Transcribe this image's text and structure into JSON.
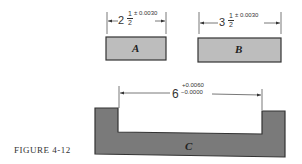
{
  "figure": {
    "caption": "FIGURE 4-12",
    "colors": {
      "part_ab_fill": "#bdbdbd",
      "part_c_fill": "#7a7a7a",
      "outline": "#333333"
    },
    "parts": [
      {
        "label": "A",
        "dimension": {
          "whole": "2",
          "numerator": "1",
          "denominator": "2",
          "tolerance": "± 0.0030"
        }
      },
      {
        "label": "B",
        "dimension": {
          "whole": "3",
          "numerator": "1",
          "denominator": "2",
          "tolerance": "± 0.0030"
        }
      },
      {
        "label": "C",
        "dimension": {
          "nominal": "6",
          "upper_tolerance": "+0.0060",
          "lower_tolerance": "−0.0000"
        }
      }
    ]
  }
}
